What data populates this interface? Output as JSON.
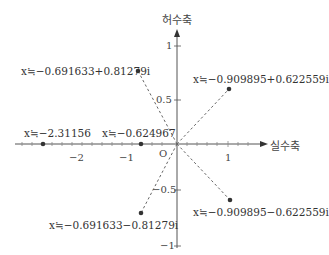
{
  "diagram": {
    "type": "complex-plane",
    "axes": {
      "real_label": "실수축",
      "imag_label": "허수축",
      "origin_label": "O"
    },
    "x_ticks": [
      {
        "label": "−2",
        "x": 77
      },
      {
        "label": "−1",
        "x": 127
      },
      {
        "label": "1",
        "x": 228
      }
    ],
    "y_ticks": [
      {
        "label": "1",
        "y": 46
      },
      {
        "label": "0.5",
        "y": 100
      },
      {
        "label": "−0.5",
        "y": 190
      },
      {
        "label": "−1",
        "y": 246
      }
    ],
    "points": [
      {
        "id": "root-real-1",
        "label": "x≒−2.31156",
        "x": 43,
        "y": 144
      },
      {
        "id": "root-real-2",
        "label": "x≒−0.624967",
        "x": 141,
        "y": 144
      },
      {
        "id": "root-upper-left",
        "label": "x≒−0.691633+0.81279i",
        "x": 138,
        "y": 71
      },
      {
        "id": "root-upper-right",
        "label": "x≒−0.909895+0.622559i",
        "x": 229,
        "y": 89
      },
      {
        "id": "root-lower-right",
        "label": "x≒−0.909895−0.622559i",
        "x": 230,
        "y": 200
      },
      {
        "id": "root-lower-left",
        "label": "x≒−0.691633−0.81279i",
        "x": 141,
        "y": 213
      }
    ]
  }
}
